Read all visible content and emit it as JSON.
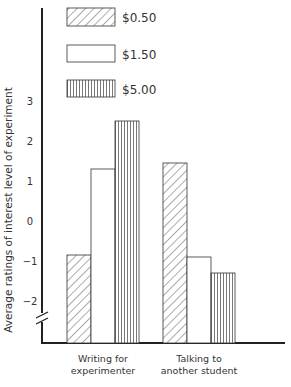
{
  "chart_data": {
    "type": "bar",
    "title": "",
    "xlabel": "",
    "ylabel": "Average ratings of interest level of experiment",
    "categories": [
      "Writing for experimenter",
      "Talking to another student"
    ],
    "category_lines": [
      [
        "Writing for",
        "experimenter"
      ],
      [
        "Talking to",
        "another student"
      ]
    ],
    "series": [
      {
        "name": "$0.50",
        "pattern": "diagonal-hatch",
        "values": [
          -0.85,
          1.45
        ]
      },
      {
        "name": "$1.50",
        "pattern": "none",
        "values": [
          1.3,
          -0.9
        ]
      },
      {
        "name": "$5.00",
        "pattern": "vertical-lines",
        "values": [
          2.5,
          -1.3
        ]
      }
    ],
    "yticks": [
      3,
      2,
      1,
      0,
      -1,
      -2
    ],
    "ytick_labels": [
      "3",
      "2",
      "1",
      "0",
      "−1",
      "−2"
    ],
    "ylim": [
      -3,
      3.5
    ],
    "axis_break": true,
    "grid": false,
    "legend_position": "top-left"
  },
  "legend": [
    {
      "label": "$0.50"
    },
    {
      "label": "$1.50"
    },
    {
      "label": "$5.00"
    }
  ]
}
